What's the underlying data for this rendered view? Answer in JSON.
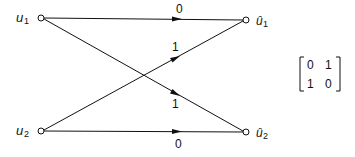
{
  "diagram": {
    "type": "signal-flow-graph",
    "nodes": {
      "u1": {
        "label": "u",
        "sub": "1"
      },
      "u2": {
        "label": "u",
        "sub": "2"
      },
      "uhat1": {
        "label": "û",
        "sub": "1"
      },
      "uhat2": {
        "label": "û",
        "sub": "2"
      }
    },
    "edges": [
      {
        "from": "u1",
        "to": "uhat1",
        "weight": "0"
      },
      {
        "from": "u2",
        "to": "uhat1",
        "weight": "1"
      },
      {
        "from": "u1",
        "to": "uhat2",
        "weight": "1"
      },
      {
        "from": "u2",
        "to": "uhat2",
        "weight": "0"
      }
    ],
    "matrix": {
      "rows": [
        [
          "0",
          "1"
        ],
        [
          "1",
          "0"
        ]
      ]
    }
  }
}
